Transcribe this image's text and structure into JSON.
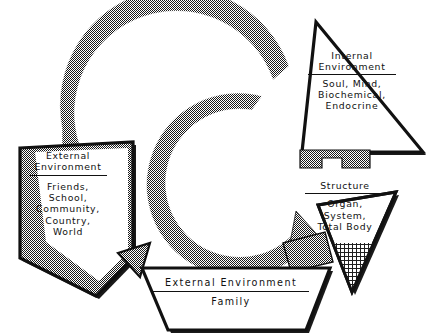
{
  "figure": {
    "background_color": "#ffffff",
    "ink_color": "#000000",
    "halftone_color": "#8a8a8a"
  },
  "cycle": {
    "description": "Two concentric halftone-textured C-shaped arcs forming a clockwise feedback loop",
    "arcs": [
      {
        "name": "outer-arc",
        "sweep_start_deg": 95,
        "sweep_end_deg": 200,
        "direction": "clockwise"
      },
      {
        "name": "inner-arc",
        "sweep_start_deg": 80,
        "sweep_end_deg": 10,
        "direction": "clockwise"
      }
    ]
  },
  "nodes": [
    {
      "id": "internal-environment",
      "shape": "triangle-up",
      "heading": "Internal Environment",
      "heading_lines": [
        "Internal",
        "Environment"
      ],
      "underline": true,
      "detail_lines": [
        "Soul, Mind,",
        "Biochemical,",
        "Endocrine"
      ],
      "fill": "white",
      "outline": "black",
      "shadow": true
    },
    {
      "id": "external-environment-left",
      "shape": "arrow-left",
      "heading": "External Environment",
      "heading_lines": [
        "External",
        "Environment"
      ],
      "underline": true,
      "detail_lines": [
        "Friends,",
        "School,",
        "Community,",
        "Country,",
        "World"
      ],
      "fill": "halftone",
      "outline": "black",
      "shadow": true
    },
    {
      "id": "structure",
      "shape": "triangle-down",
      "heading": "Structure",
      "heading_lines": [
        "Structure"
      ],
      "underline": true,
      "detail_lines": [
        "Organ,",
        "System,",
        "Total Body"
      ],
      "fill": "crosshatch",
      "outline": "black",
      "shadow": true
    },
    {
      "id": "external-environment-bottom",
      "shape": "arrow-down",
      "heading": "External Environment",
      "heading_lines": [
        "External Environment"
      ],
      "underline": true,
      "detail_lines": [
        "Family"
      ],
      "fill": "white",
      "outline": "black",
      "shadow": true
    }
  ]
}
